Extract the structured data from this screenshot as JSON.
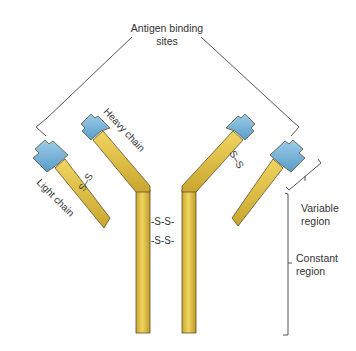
{
  "diagram": {
    "labels": {
      "antigen_binding_sites_line1": "Antigen binding",
      "antigen_binding_sites_line2": "sites",
      "heavy_chain": "Heavy chain",
      "light_chain": "Light chain",
      "variable_region_line1": "Variable",
      "variable_region_line2": "region",
      "constant_region_line1": "Constant",
      "constant_region_line2": "region",
      "disulfide_bond": "S–S",
      "disulfide_hinge_1": "-S-S-",
      "disulfide_hinge_2": "-S-S-",
      "disulfide_left": "S–S",
      "disulfide_right": "S–S"
    },
    "colors": {
      "constant_region": "#e2c24a",
      "constant_region_dark": "#c9a62e",
      "variable_region": "#7fb8dc",
      "variable_region_dark": "#5a9cc8",
      "outline": "#5a5030",
      "leader_lines": "#444444",
      "text": "#333333",
      "background": "#ffffff"
    },
    "components": [
      {
        "name": "Heavy chain (left)",
        "regions": [
          "variable",
          "constant"
        ]
      },
      {
        "name": "Heavy chain (right)",
        "regions": [
          "variable",
          "constant"
        ]
      },
      {
        "name": "Light chain (left)",
        "regions": [
          "variable",
          "constant"
        ]
      },
      {
        "name": "Light chain (right)",
        "regions": [
          "variable",
          "constant"
        ]
      },
      {
        "name": "Disulfide bonds",
        "count": 4
      }
    ]
  }
}
